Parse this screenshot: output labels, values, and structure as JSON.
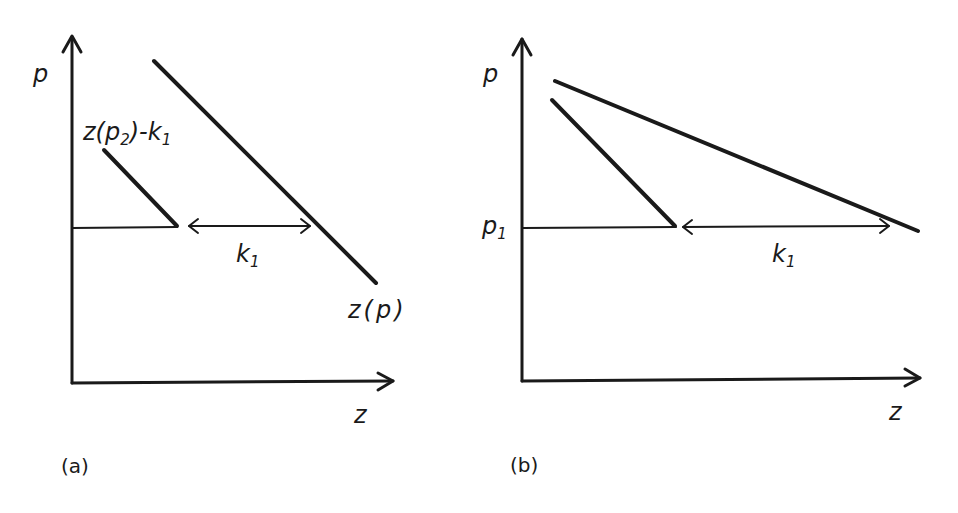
{
  "panels": [
    {
      "id": "a",
      "caption": "(a)",
      "y_axis_label": "p",
      "x_axis_label": "z",
      "curve_label": "z(p)",
      "shifted_curve_label": "z(p₂)-k₁",
      "shifted_curve_label_parts": {
        "pre": "z(p",
        "sub1": "2",
        "mid": ")-k",
        "sub2": "1"
      },
      "gap_label": {
        "base": "k",
        "sub": "1"
      }
    },
    {
      "id": "b",
      "caption": "(b)",
      "y_axis_label": "p",
      "x_axis_label": "z",
      "level_label": {
        "base": "p",
        "sub": "1"
      },
      "gap_label": {
        "base": "k",
        "sub": "1"
      }
    }
  ],
  "colors": {
    "ink": "#1a1a1a",
    "background": "#ffffff"
  }
}
